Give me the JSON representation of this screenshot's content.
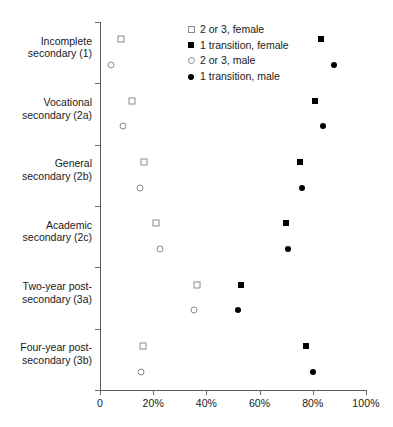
{
  "chart_data": {
    "type": "scatter",
    "title": "",
    "subtitle": "",
    "xlabel": "",
    "ylabel": "",
    "xlim": [
      0,
      100
    ],
    "grid": false,
    "legend_position": "top-center",
    "xticks": [
      {
        "value": 0,
        "label": "0"
      },
      {
        "value": 20,
        "label": "20%"
      },
      {
        "value": 40,
        "label": "40%"
      },
      {
        "value": 60,
        "label": "60%"
      },
      {
        "value": 80,
        "label": "80%"
      },
      {
        "value": 100,
        "label": "100%"
      }
    ],
    "categories": [
      "Incomplete\nsecondary (1)",
      "Vocational\nsecondary (2a)",
      "General\nsecondary (2b)",
      "Academic\nsecondary (2c)",
      "Two-year post-\nsecondary (3a)",
      "Four-year post-\nsecondary (3b)"
    ],
    "series": [
      {
        "name": "2 or 3, female",
        "marker": "square-open",
        "values": [
          8,
          12,
          16.5,
          21,
          36.5,
          16
        ]
      },
      {
        "name": "1 transition, female",
        "marker": "square-filled",
        "values": [
          83,
          81,
          75,
          70,
          53,
          77.5
        ]
      },
      {
        "name": "2 or 3, male",
        "marker": "circle-open",
        "values": [
          4,
          8.5,
          15,
          22.5,
          35.5,
          15.5
        ]
      },
      {
        "name": "1 transition, male",
        "marker": "circle-filled",
        "values": [
          88,
          84,
          76,
          70.5,
          52,
          80
        ]
      }
    ]
  },
  "legend": {
    "items": [
      {
        "label": "2 or 3, female",
        "marker": "square-open"
      },
      {
        "label": "1 transition, female",
        "marker": "square-filled"
      },
      {
        "label": "2 or 3, male",
        "marker": "circle-open"
      },
      {
        "label": "1 transition, male",
        "marker": "circle-filled"
      }
    ]
  }
}
